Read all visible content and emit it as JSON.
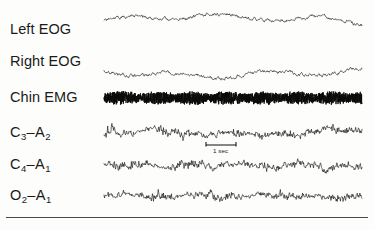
{
  "figure": {
    "background_color": "#fdfdfc",
    "trace_color": "#111111",
    "width": 375,
    "height": 230
  },
  "channels": [
    {
      "id": "left-eog",
      "label_main": "Left EOG",
      "label_sub": "",
      "label_sub2": "",
      "baseline_y": 30,
      "type": "eog"
    },
    {
      "id": "right-eog",
      "label_main": "Right EOG",
      "label_sub": "",
      "label_sub2": "",
      "baseline_y": 62,
      "type": "eog"
    },
    {
      "id": "chin-emg",
      "label_main": "Chin EMG",
      "label_sub": "",
      "label_sub2": "",
      "baseline_y": 98,
      "type": "emg"
    },
    {
      "id": "c3-a2",
      "label_main": "C",
      "label_sub": "3",
      "label_mid": "A",
      "label_sub2": "2",
      "baseline_y": 133,
      "type": "eeg"
    },
    {
      "id": "c4-a1",
      "label_main": "C",
      "label_sub": "4",
      "label_mid": "A",
      "label_sub2": "1",
      "baseline_y": 165,
      "type": "eeg"
    },
    {
      "id": "o2-a1",
      "label_main": "O",
      "label_sub": "2",
      "label_mid": "A",
      "label_sub2": "1",
      "baseline_y": 196,
      "type": "eeg"
    }
  ],
  "label_positions": {
    "left_eog": 22,
    "right_eog": 54,
    "chin_emg": 90,
    "c3_a2": 125,
    "c4_a1": 157,
    "o2_a1": 188
  },
  "calibration": {
    "text": "1 sec",
    "bar_x_start": 206,
    "bar_x_end": 236,
    "bar_y": 145,
    "text_x": 213,
    "text_y": 147
  },
  "separator_rule": {
    "x": 6,
    "y": 217,
    "width": 362
  },
  "chart_data": {
    "type": "line",
    "xlabel": "Time",
    "ylabel": "Channel",
    "grid": false,
    "legend_position": "left-labels",
    "x_axis": {
      "units": "seconds",
      "calibration_bar": "1 sec",
      "trace_start_px": 104,
      "trace_end_px": 362
    },
    "annotations": [
      "1 sec"
    ],
    "series": [
      {
        "name": "Left EOG",
        "description": "Slow high-amplitude conjugate eye movement deflections, out of phase with Right EOG",
        "baseline_y": 30,
        "amplitude": 17,
        "noise": 1.4,
        "waves": [
          {
            "center_frac": 0.1,
            "width_frac": 0.2,
            "amp": -13
          },
          {
            "center_frac": 0.45,
            "width_frac": 0.22,
            "amp": -16
          },
          {
            "center_frac": 0.83,
            "width_frac": 0.21,
            "amp": -13
          }
        ]
      },
      {
        "name": "Right EOG",
        "description": "Mirror image of Left EOG, confirming conjugate eye movements",
        "baseline_y": 62,
        "amplitude": 17,
        "noise": 1.4,
        "waves": [
          {
            "center_frac": 0.1,
            "width_frac": 0.2,
            "amp": 13
          },
          {
            "center_frac": 0.45,
            "width_frac": 0.22,
            "amp": 16
          },
          {
            "center_frac": 0.83,
            "width_frac": 0.21,
            "amp": 13
          }
        ]
      },
      {
        "name": "Chin EMG",
        "description": "Low-amplitude tonic muscle atonia with dense high-frequency activity",
        "baseline_y": 98,
        "amplitude": 4.5,
        "noise": 4.0,
        "frequency": "high"
      },
      {
        "name": "C3-A2",
        "description": "Low-voltage mixed-frequency EEG activity",
        "baseline_y": 133,
        "amplitude": 8,
        "noise": 3.4,
        "frequency": "mixed"
      },
      {
        "name": "C4-A1",
        "description": "Low-voltage mixed-frequency EEG activity",
        "baseline_y": 165,
        "amplitude": 8,
        "noise": 3.4,
        "frequency": "mixed"
      },
      {
        "name": "O2-A1",
        "description": "Low-voltage mixed-frequency EEG activity",
        "baseline_y": 196,
        "amplitude": 8,
        "noise": 3.2,
        "frequency": "mixed"
      }
    ]
  }
}
